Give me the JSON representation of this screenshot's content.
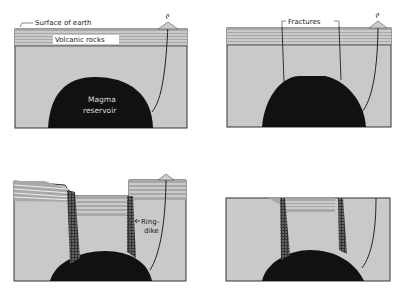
{
  "figure": {
    "panels": [
      {
        "id": "panel-1",
        "labels": {
          "surface": "Surface of earth",
          "volcanic": "Volcanic rocks",
          "magma_line1": "Magma",
          "magma_line2": "reservoir"
        }
      },
      {
        "id": "panel-2",
        "labels": {
          "fractures": "Fractures"
        }
      },
      {
        "id": "panel-3",
        "labels": {
          "ringdike_line1": "Ring-",
          "ringdike_line2": "dike"
        }
      },
      {
        "id": "panel-4",
        "labels": {}
      }
    ],
    "caption": ""
  },
  "colors": {
    "ground": "#c9c9c9",
    "strata": "#a0a0a0",
    "magma": "#111111",
    "outline": "#333333"
  }
}
